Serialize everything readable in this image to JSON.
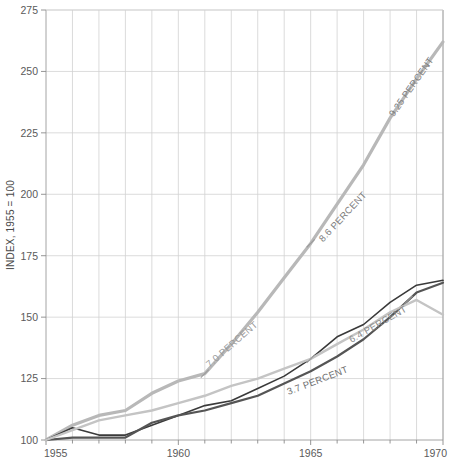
{
  "chart_data": {
    "type": "line",
    "title": "",
    "subtitle": "",
    "xlabel": "",
    "ylabel": "INDEX, 1955 = 100",
    "xlim": [
      1955,
      1970
    ],
    "ylim": [
      100,
      275
    ],
    "ytick_labels": [
      "100",
      "125",
      "150",
      "175",
      "200",
      "225",
      "250",
      "275"
    ],
    "ytick_values": [
      100,
      125,
      150,
      175,
      200,
      225,
      250,
      275
    ],
    "xtick_labels": [
      "1955",
      "1960",
      "1965",
      "1970"
    ],
    "xtick_values": [
      1955,
      1960,
      1965,
      1970
    ],
    "x_minor_ticks": [
      1956,
      1957,
      1958,
      1959,
      1961,
      1962,
      1963,
      1964,
      1966,
      1967,
      1968,
      1969
    ],
    "grid": "both",
    "legend": "none",
    "x": [
      1955,
      1956,
      1957,
      1958,
      1959,
      1960,
      1961,
      1962,
      1963,
      1964,
      1965,
      1966,
      1967,
      1968,
      1969,
      1970
    ],
    "series": [
      {
        "name": "steep-growth-series",
        "color": "#b8b8b8",
        "width": 3.2,
        "values": [
          100,
          106,
          110,
          112,
          119,
          124,
          127,
          139,
          152,
          166,
          180,
          196,
          212,
          231,
          247,
          262
        ]
      },
      {
        "name": "upper-dark-series",
        "color": "#3a3a3a",
        "width": 1.6,
        "values": [
          100,
          105,
          102,
          102,
          106,
          110,
          114,
          116,
          121,
          126,
          133,
          142,
          147,
          156,
          163,
          165
        ]
      },
      {
        "name": "mid-dark-series",
        "color": "#555555",
        "width": 2.2,
        "values": [
          100,
          101,
          101,
          101,
          107,
          110,
          112,
          115,
          118,
          123,
          128,
          134,
          141,
          150,
          160,
          164
        ]
      },
      {
        "name": "lower-light-series",
        "color": "#c4c4c4",
        "width": 2.4,
        "values": [
          100,
          104,
          108,
          110,
          112,
          115,
          118,
          122,
          125,
          129,
          133,
          139,
          145,
          152,
          157,
          151
        ]
      }
    ],
    "annotations": [
      {
        "name": "annotation-7-0-percent",
        "text": "7.0 PERCENT",
        "x": 1962.1,
        "y": 138,
        "rotation": -41,
        "color": "#9a9a9a"
      },
      {
        "name": "annotation-8-6-percent",
        "text": "8.6 PERCENT",
        "x": 1966.3,
        "y": 190,
        "rotation": -47,
        "color": "#7d7d7d"
      },
      {
        "name": "annotation-9-25-percent",
        "text": "9.25 PERCENT",
        "x": 1968.9,
        "y": 243,
        "rotation": -55,
        "color": "#7d7d7d"
      },
      {
        "name": "annotation-6-4-percent",
        "text": "6.4 PERCENT",
        "x": 1967.6,
        "y": 146,
        "rotation": -30,
        "color": "#8a8a8a"
      },
      {
        "name": "annotation-3-7-percent",
        "text": "3.7 PERCENT",
        "x": 1965.3,
        "y": 123,
        "rotation": -21,
        "color": "#6f6f6f"
      }
    ],
    "markers": [
      {
        "name": "segment-marker-1961",
        "x": 1961,
        "y": 127
      },
      {
        "name": "segment-marker-1965",
        "x": 1965,
        "y": 180
      },
      {
        "name": "segment-marker-1965-lower",
        "x": 1965,
        "y": 133
      },
      {
        "name": "segment-marker-1969",
        "x": 1968.7,
        "y": 157
      }
    ]
  }
}
